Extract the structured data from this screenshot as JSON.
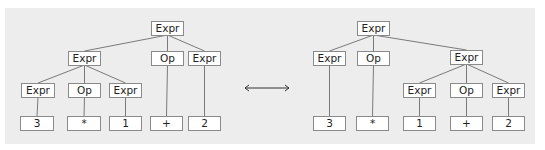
{
  "colors": {
    "panel_bg": "#ededed",
    "node_bg": "#ffffff",
    "node_border": "#8a8a8a",
    "edge": "#7a7a7a",
    "text": "#222222"
  },
  "equivalence_arrow": {
    "symbol": "double-arrow",
    "x1": 245,
    "x2": 289,
    "y": 88
  },
  "trees": [
    {
      "name": "left-tree",
      "nodes": [
        {
          "id": "L0",
          "label": "Expr",
          "x": 151,
          "y": 21,
          "w": 33
        },
        {
          "id": "L1",
          "label": "Expr",
          "x": 68,
          "y": 51,
          "w": 33
        },
        {
          "id": "L2",
          "label": "Op",
          "x": 151,
          "y": 51,
          "w": 33
        },
        {
          "id": "L3",
          "label": "Expr",
          "x": 188,
          "y": 51,
          "w": 33
        },
        {
          "id": "L4",
          "label": "Expr",
          "x": 21,
          "y": 83,
          "w": 34
        },
        {
          "id": "L5",
          "label": "Op",
          "x": 68,
          "y": 83,
          "w": 33
        },
        {
          "id": "L6",
          "label": "Expr",
          "x": 109,
          "y": 83,
          "w": 33
        },
        {
          "id": "L7",
          "label": "3",
          "x": 20,
          "y": 116,
          "w": 34
        },
        {
          "id": "L8",
          "label": "*",
          "x": 67,
          "y": 116,
          "w": 34
        },
        {
          "id": "L9",
          "label": "1",
          "x": 109,
          "y": 116,
          "w": 33
        },
        {
          "id": "L10",
          "label": "+",
          "x": 150,
          "y": 116,
          "w": 33
        },
        {
          "id": "L11",
          "label": "2",
          "x": 188,
          "y": 116,
          "w": 33
        }
      ],
      "edges": [
        [
          "L0",
          "L1"
        ],
        [
          "L0",
          "L2"
        ],
        [
          "L0",
          "L3"
        ],
        [
          "L1",
          "L4"
        ],
        [
          "L1",
          "L5"
        ],
        [
          "L1",
          "L6"
        ],
        [
          "L4",
          "L7"
        ],
        [
          "L5",
          "L8"
        ],
        [
          "L6",
          "L9"
        ],
        [
          "L2",
          "L10"
        ],
        [
          "L3",
          "L11"
        ]
      ]
    },
    {
      "name": "right-tree",
      "nodes": [
        {
          "id": "R0",
          "label": "Expr",
          "x": 357,
          "y": 21,
          "w": 33
        },
        {
          "id": "R1",
          "label": "Expr",
          "x": 313,
          "y": 51,
          "w": 33
        },
        {
          "id": "R2",
          "label": "Op",
          "x": 357,
          "y": 51,
          "w": 33
        },
        {
          "id": "R3",
          "label": "Expr",
          "x": 450,
          "y": 50,
          "w": 33
        },
        {
          "id": "R4",
          "label": "Expr",
          "x": 403,
          "y": 83,
          "w": 33
        },
        {
          "id": "R5",
          "label": "Op",
          "x": 450,
          "y": 83,
          "w": 33
        },
        {
          "id": "R6",
          "label": "Expr",
          "x": 492,
          "y": 83,
          "w": 33
        },
        {
          "id": "R7",
          "label": "3",
          "x": 313,
          "y": 116,
          "w": 33
        },
        {
          "id": "R8",
          "label": "*",
          "x": 356,
          "y": 116,
          "w": 33
        },
        {
          "id": "R9",
          "label": "1",
          "x": 403,
          "y": 116,
          "w": 33
        },
        {
          "id": "R10",
          "label": "+",
          "x": 450,
          "y": 116,
          "w": 33
        },
        {
          "id": "R11",
          "label": "2",
          "x": 492,
          "y": 116,
          "w": 33
        }
      ],
      "edges": [
        [
          "R0",
          "R1"
        ],
        [
          "R0",
          "R2"
        ],
        [
          "R0",
          "R3"
        ],
        [
          "R1",
          "R7"
        ],
        [
          "R2",
          "R8"
        ],
        [
          "R3",
          "R4"
        ],
        [
          "R3",
          "R5"
        ],
        [
          "R3",
          "R6"
        ],
        [
          "R4",
          "R9"
        ],
        [
          "R5",
          "R10"
        ],
        [
          "R6",
          "R11"
        ]
      ]
    }
  ]
}
